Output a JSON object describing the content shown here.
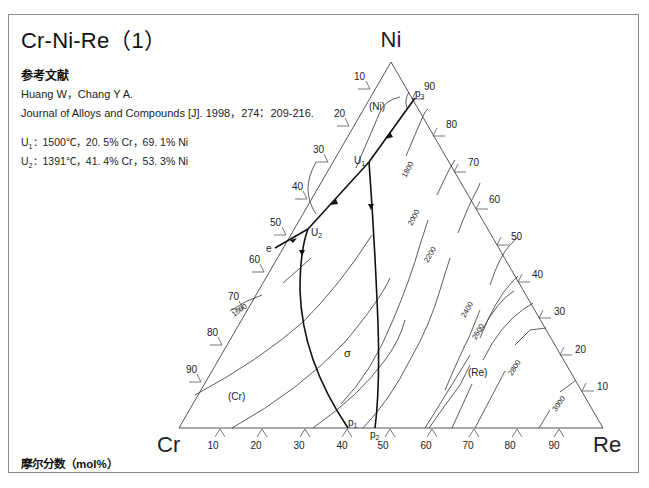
{
  "title": "Cr-Ni-Re（1）",
  "reference": {
    "heading": "参考文献",
    "authors": "Huang W，Chang Y A.",
    "citation": "Journal of Alloys and Compounds [J]. 1998，274：209-216."
  },
  "invariant_points": [
    {
      "label": "U",
      "sub": "1",
      "text": "：1500℃，20. 5% Cr，69. 1% Ni"
    },
    {
      "label": "U",
      "sub": "2",
      "text": "：1391℃，41. 4% Cr，53. 3% Ni"
    }
  ],
  "footer": "摩尔分数（mol%）",
  "diagram": {
    "type": "ternary-liquidus-projection",
    "vertices": {
      "top": "Ni",
      "left": "Cr",
      "right": "Re"
    },
    "left_axis_ticks": [
      "10",
      "20",
      "30",
      "40",
      "50",
      "60",
      "70",
      "80",
      "90"
    ],
    "right_axis_ticks": [
      "90",
      "80",
      "70",
      "60",
      "50",
      "40",
      "30",
      "20",
      "10"
    ],
    "bottom_axis_ticks": [
      "10",
      "20",
      "30",
      "40",
      "50",
      "60",
      "70",
      "80",
      "90"
    ],
    "phase_labels": [
      "(Ni)",
      "(Cr)",
      "σ",
      "(Re)"
    ],
    "point_labels": {
      "U1": "U",
      "U1_sub": "1",
      "U2": "U",
      "U2_sub": "2",
      "p1": "p",
      "p1_sub": "1",
      "p2": "p",
      "p2_sub": "2",
      "p3": "p",
      "p3_sub": "3",
      "e": "e"
    },
    "isotherms": [
      "1600",
      "1800",
      "2000",
      "2200",
      "2400",
      "2600",
      "2800",
      "3000"
    ],
    "units": "℃"
  }
}
